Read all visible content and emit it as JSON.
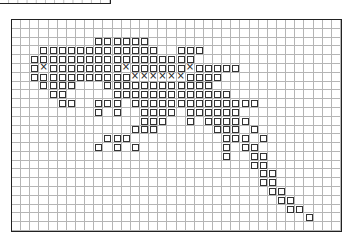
{
  "grid": {
    "columns": 36,
    "rows": 24,
    "legend": {
      "square": "sq",
      "cross": "x"
    },
    "marks": {
      "2": {
        "sq": [
          9,
          10,
          11,
          12,
          13,
          14
        ]
      },
      "3": {
        "sq": [
          3,
          4,
          5,
          6,
          7,
          8,
          9,
          10,
          11,
          12,
          13,
          14,
          15,
          18,
          19,
          20
        ]
      },
      "4": {
        "sq": [
          2,
          3,
          4,
          5,
          6,
          7,
          8,
          9,
          10,
          11,
          12,
          13,
          14,
          15,
          16,
          17,
          18,
          19
        ]
      },
      "5": {
        "sq": [
          2,
          4,
          5,
          6,
          7,
          8,
          9,
          10,
          11,
          13,
          14,
          15,
          16,
          17,
          18,
          20,
          21,
          22,
          23,
          24
        ],
        "x": [
          3,
          12,
          19
        ]
      },
      "6": {
        "sq": [
          2,
          3,
          4,
          5,
          6,
          7,
          8,
          9,
          10,
          11,
          12,
          19,
          20,
          21,
          22
        ],
        "x": [
          13,
          14,
          15,
          16,
          17,
          18
        ]
      },
      "7": {
        "sq": [
          3,
          4,
          5,
          6,
          10,
          11,
          12,
          13,
          14,
          15,
          16,
          17,
          18,
          19,
          20,
          21
        ]
      },
      "8": {
        "sq": [
          4,
          5,
          11,
          12,
          13,
          14,
          15,
          16,
          17,
          18,
          19,
          20,
          21,
          22,
          23
        ]
      },
      "9": {
        "sq": [
          5,
          6,
          9,
          10,
          11,
          13,
          14,
          15,
          16,
          17,
          18,
          19,
          20,
          21,
          22,
          23,
          24,
          25,
          26
        ]
      },
      "10": {
        "sq": [
          9,
          11,
          14,
          15,
          16,
          17,
          19,
          20,
          21,
          22,
          23,
          24
        ]
      },
      "11": {
        "sq": [
          14,
          15,
          16,
          19,
          21,
          22,
          23,
          24,
          25
        ]
      },
      "12": {
        "sq": [
          13,
          14,
          15,
          22,
          23,
          24,
          26
        ]
      },
      "13": {
        "sq": [
          10,
          11,
          12,
          23,
          24,
          25,
          27
        ]
      },
      "14": {
        "sq": [
          9,
          11,
          13,
          23,
          25,
          26
        ]
      },
      "15": {
        "sq": [
          23,
          26,
          27
        ]
      },
      "16": {
        "sq": [
          26,
          27
        ]
      },
      "17": {
        "sq": [
          27,
          28
        ]
      },
      "18": {
        "sq": [
          27,
          28
        ]
      },
      "19": {
        "sq": [
          28,
          29
        ]
      },
      "20": {
        "sq": [
          29,
          30
        ]
      },
      "21": {
        "sq": [
          30,
          31
        ]
      },
      "22": {
        "sq": [
          32
        ]
      }
    }
  }
}
